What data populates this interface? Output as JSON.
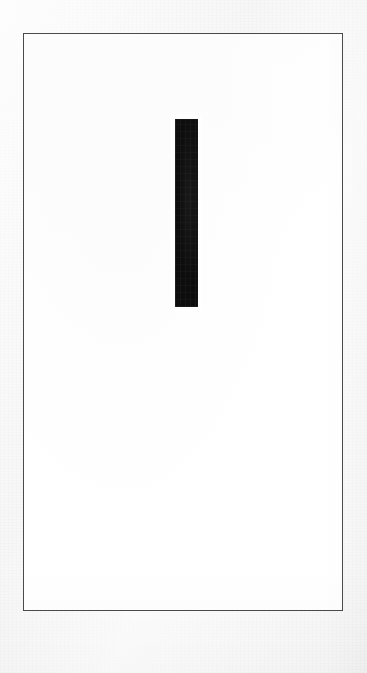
{
  "canvas": {
    "width": 367,
    "height": 673,
    "background_color": "#f7f7f7",
    "description": "Scanned sheet of paper"
  },
  "frame": {
    "name": "ruled rectangle border",
    "x": 23,
    "y": 33,
    "width": 320,
    "height": 578,
    "stroke_color": "#4a4a4a",
    "stroke_width": 1,
    "fill_color": "#ffffff"
  },
  "artwork": {
    "title": "",
    "shapes": [
      {
        "id": "vertical-bar",
        "type": "rectangle",
        "x": 174,
        "y": 118,
        "width": 23,
        "height": 188,
        "fill_color": "#0d0d0d"
      }
    ]
  },
  "chart_data": {
    "type": "bar",
    "title": "",
    "subtitle": "",
    "xlabel": "",
    "ylabel": "",
    "categories": [
      ""
    ],
    "values": [
      188
    ],
    "series": [
      {
        "name": "bar",
        "values": [
          188
        ]
      }
    ],
    "bar_color": "#0d0d0d",
    "bar_width_px": 23,
    "plot_area": {
      "x": 23,
      "y": 33,
      "width": 320,
      "height": 578
    },
    "grid": false,
    "legend": false,
    "axis_visible": false,
    "tick_labels": [],
    "annotations": []
  }
}
